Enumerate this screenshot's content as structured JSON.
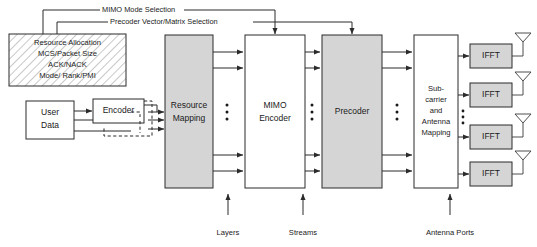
{
  "diagram": {
    "control_lines": [
      {
        "id": "mimo-mode",
        "label": "MIMO Mode Selection"
      },
      {
        "id": "precoder-sel",
        "label": "Precoder Vector/Matrix Selection"
      }
    ],
    "control_block": {
      "name": "resource-allocation-block",
      "lines": [
        "Resource Allocation",
        "MCS/Packet Size",
        "ACK/NACK",
        "Mode/ Rank/PMI"
      ],
      "fill": "hatched"
    },
    "blocks": [
      {
        "id": "user-data",
        "lines": [
          "User",
          "Data"
        ],
        "fill": "#ffffff"
      },
      {
        "id": "encoder",
        "lines": [
          "Encoder"
        ],
        "fill": "#ffffff"
      },
      {
        "id": "resource-mapping",
        "lines": [
          "Resource",
          "Mapping"
        ],
        "fill": "#d5d5d5"
      },
      {
        "id": "mimo-encoder",
        "lines": [
          "MIMO",
          "Encoder"
        ],
        "fill": "#ffffff"
      },
      {
        "id": "precoder",
        "lines": [
          "Precoder"
        ],
        "fill": "#d5d5d5"
      },
      {
        "id": "subcarrier-antenna-mapping",
        "lines": [
          "Sub-",
          "carrier",
          "and",
          "Antenna",
          "Mapping"
        ],
        "fill": "#ffffff"
      }
    ],
    "ifft_blocks": [
      {
        "id": "ifft-1",
        "label": "IFFT",
        "fill": "#d5d5d5"
      },
      {
        "id": "ifft-2",
        "label": "IFFT",
        "fill": "#d5d5d5"
      },
      {
        "id": "ifft-3",
        "label": "IFFT",
        "fill": "#d5d5d5"
      },
      {
        "id": "ifft-4",
        "label": "IFFT",
        "fill": "#d5d5d5"
      }
    ],
    "antennas_count": 4,
    "bottom_labels": [
      {
        "id": "layers",
        "label": "Layers"
      },
      {
        "id": "streams",
        "label": "Streams"
      },
      {
        "id": "antenna-ports",
        "label": "Antenna Ports"
      }
    ],
    "ellipsis_groups": 4
  }
}
